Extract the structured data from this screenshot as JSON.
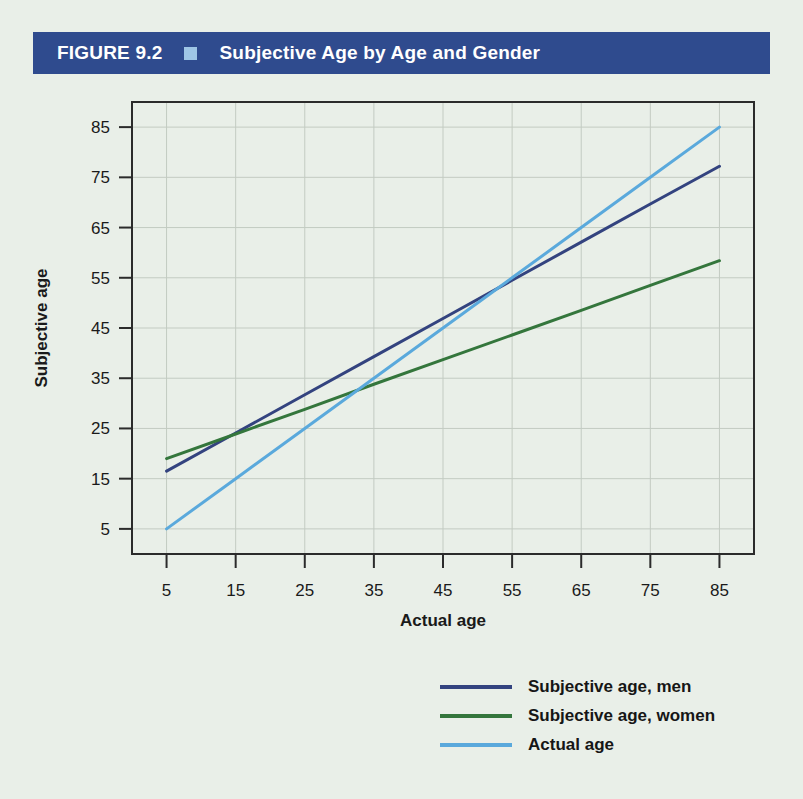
{
  "header": {
    "figure_number": "FIGURE 9.2",
    "marker_icon": "square-marker-icon",
    "title": "Subjective Age by Age and Gender",
    "bar_color": "#2f4b8e",
    "marker_color": "#9fc6e6",
    "text_color": "#ffffff"
  },
  "page": {
    "background_color": "#e9efe8"
  },
  "chart_data": {
    "type": "line",
    "title": "Subjective Age by Age and Gender",
    "xlabel": "Actual age",
    "ylabel": "Subjective age",
    "x": [
      5,
      15,
      25,
      35,
      45,
      55,
      65,
      75,
      85
    ],
    "xlim": [
      0,
      90
    ],
    "ylim": [
      0,
      90
    ],
    "xticks": [
      5,
      15,
      25,
      35,
      45,
      55,
      65,
      75,
      85
    ],
    "yticks": [
      5,
      15,
      25,
      35,
      45,
      55,
      65,
      75,
      85
    ],
    "xticklabels": [
      "5",
      "15",
      "25",
      "35",
      "45",
      "55",
      "65",
      "75",
      "85"
    ],
    "yticklabels": [
      "5",
      "15",
      "25",
      "35",
      "45",
      "55",
      "65",
      "75",
      "85"
    ],
    "grid": true,
    "grid_color": "#c3cbc2",
    "legend_position": "below-right",
    "series": [
      {
        "name": "Subjective age, men",
        "color": "#33437f",
        "values": [
          16.5,
          24.1,
          31.7,
          39.3,
          46.9,
          54.5,
          62.1,
          69.7,
          77.2
        ]
      },
      {
        "name": "Subjective age, women",
        "color": "#34763c",
        "values": [
          19.0,
          23.9,
          28.8,
          33.8,
          38.7,
          43.6,
          48.5,
          53.5,
          58.4
        ]
      },
      {
        "name": "Actual age",
        "color": "#5aa9dc",
        "values": [
          5,
          15,
          25,
          35,
          45,
          55,
          65,
          75,
          85
        ]
      }
    ]
  },
  "legend": {
    "items": [
      {
        "label": "Subjective age, men",
        "color": "#33437f"
      },
      {
        "label": "Subjective age, women",
        "color": "#34763c"
      },
      {
        "label": "Actual age",
        "color": "#5aa9dc"
      }
    ]
  },
  "axes": {
    "x_title": "Actual age",
    "y_title": "Subjective age",
    "axis_color": "#2b2b2b"
  }
}
